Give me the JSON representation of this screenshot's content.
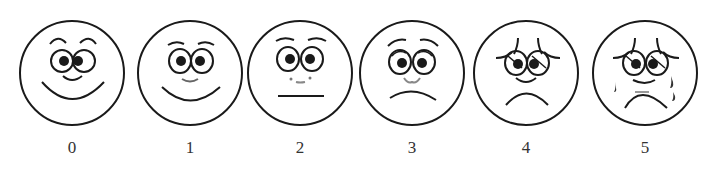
{
  "stroke_color": "#1a1a1a",
  "faces": [
    {
      "label": "0",
      "expression": "very-happy",
      "center_x": 72
    },
    {
      "label": "1",
      "expression": "happy",
      "center_x": 190
    },
    {
      "label": "2",
      "expression": "neutral",
      "center_x": 300
    },
    {
      "label": "3",
      "expression": "slightly-sad",
      "center_x": 412
    },
    {
      "label": "4",
      "expression": "sad",
      "center_x": 526
    },
    {
      "label": "5",
      "expression": "crying",
      "center_x": 645
    }
  ]
}
